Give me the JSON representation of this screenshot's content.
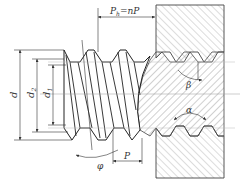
{
  "diagram": {
    "type": "screw-thread-engagement",
    "labels": {
      "lead": "P",
      "lead_sub": "h",
      "lead_eq": "=nP",
      "major_diameter": "d",
      "pitch_diameter": "d",
      "pitch_diameter_sub": "2",
      "minor_diameter": "d",
      "minor_diameter_sub": "1",
      "lead_angle": "φ",
      "pitch": "P",
      "flank_angle": "β",
      "profile_angle": "α"
    },
    "caption": " "
  }
}
